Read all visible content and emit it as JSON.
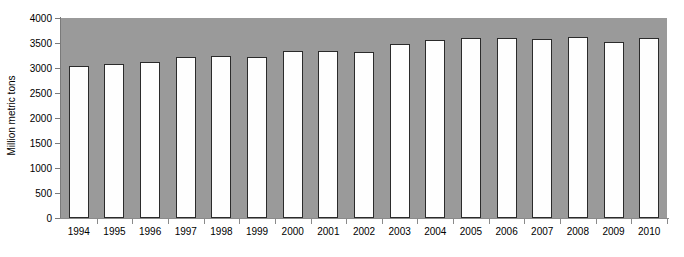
{
  "chart_data": {
    "type": "bar",
    "title": "",
    "subtitle": "",
    "xlabel": "",
    "ylabel": "Million metric tons",
    "categories": [
      "1994",
      "1995",
      "1996",
      "1997",
      "1998",
      "1999",
      "2000",
      "2001",
      "2002",
      "2003",
      "2004",
      "2005",
      "2006",
      "2007",
      "2008",
      "2009",
      "2010"
    ],
    "values": [
      3040,
      3080,
      3120,
      3230,
      3240,
      3220,
      3340,
      3340,
      3320,
      3480,
      3560,
      3600,
      3600,
      3580,
      3620,
      3520,
      3600
    ],
    "ylim": [
      0,
      4000
    ],
    "yticks": [
      0,
      500,
      1000,
      1500,
      2000,
      2500,
      3000,
      3500,
      4000
    ],
    "ytick_labels": [
      "0",
      "500",
      "1000",
      "1500",
      "2000",
      "2500",
      "3000",
      "3500",
      "4000"
    ],
    "grid": false,
    "legend": false,
    "legend_position": "none",
    "series": [
      {
        "name": "Million metric tons",
        "values": [
          3040,
          3080,
          3120,
          3230,
          3240,
          3220,
          3340,
          3340,
          3320,
          3480,
          3560,
          3600,
          3600,
          3580,
          3620,
          3520,
          3600
        ]
      }
    ]
  },
  "colors": {
    "plot_background": "#9a9a9a",
    "page_background": "#ffffff",
    "bar_fill": "#fefefe",
    "bar_outline": "#2b2b2b",
    "axis": "#8a8a8a",
    "text": "#000000"
  }
}
